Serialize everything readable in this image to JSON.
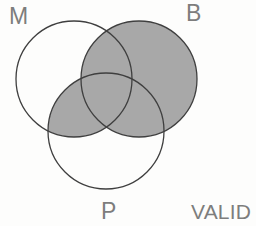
{
  "diagram": {
    "type": "venn-3-circle",
    "conclusion_label": "VALID",
    "stroke_color": "#3f3f3f",
    "shade_color": "#a8a8a8",
    "label_color": "#7d7d7d",
    "background_color": "#fdfdfc",
    "stroke_width": 1.3,
    "circles": [
      {
        "id": "M",
        "label": "M",
        "cx": 74,
        "cy": 79,
        "r": 58,
        "filled": false
      },
      {
        "id": "B",
        "label": "B",
        "cx": 139,
        "cy": 79,
        "r": 58,
        "filled": true
      },
      {
        "id": "P",
        "label": "P",
        "cx": 106,
        "cy": 131,
        "r": 58,
        "filled": false
      }
    ],
    "labels": [
      {
        "id": "M",
        "text": "M",
        "position": "top-left"
      },
      {
        "id": "B",
        "text": "B",
        "position": "top-right"
      },
      {
        "id": "P",
        "text": "P",
        "position": "bottom-center"
      },
      {
        "id": "VALID",
        "text": "VALID",
        "position": "bottom-right"
      }
    ],
    "shaded_regions": [
      {
        "id": "B-only",
        "description": "B not M not P",
        "shaded": true
      },
      {
        "id": "B-and-M",
        "description": "B and M not P",
        "shaded": true
      },
      {
        "id": "B-and-P",
        "description": "B and P not M",
        "shaded": true
      },
      {
        "id": "M-and-B-and-P",
        "description": "M and B and P",
        "shaded": true
      },
      {
        "id": "M-and-P",
        "description": "M and P not B",
        "shaded": true
      },
      {
        "id": "M-only",
        "description": "M not B not P",
        "shaded": false
      },
      {
        "id": "P-only",
        "description": "P not M not B",
        "shaded": false
      }
    ]
  }
}
